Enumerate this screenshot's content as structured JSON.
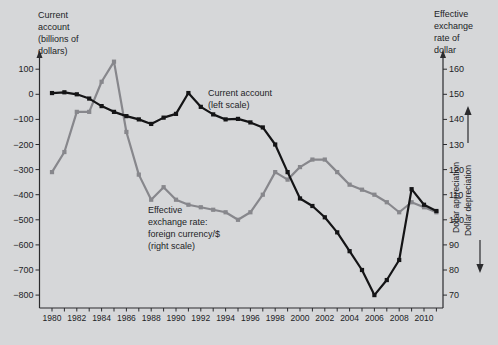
{
  "figure_title": "US current account and effective exchange rate of the dollar, 1980-2011",
  "chart_data": {
    "type": "line",
    "x": [
      1980,
      1981,
      1982,
      1983,
      1984,
      1985,
      1986,
      1987,
      1988,
      1989,
      1990,
      1991,
      1992,
      1993,
      1994,
      1995,
      1996,
      1997,
      1998,
      1999,
      2000,
      2001,
      2002,
      2003,
      2004,
      2005,
      2006,
      2007,
      2008,
      2009,
      2010,
      2011
    ],
    "series": [
      {
        "name": "Current account (left scale)",
        "axis": "left",
        "color": "#141416",
        "values": [
          5,
          8,
          0,
          -17,
          -47,
          -70,
          -87,
          -100,
          -118,
          -93,
          -78,
          5,
          -50,
          -80,
          -100,
          -98,
          -112,
          -132,
          -200,
          -310,
          -415,
          -445,
          -490,
          -550,
          -625,
          -700,
          -800,
          -740,
          -660,
          -378,
          -440,
          -465
        ]
      },
      {
        "name": "Effective exchange rate: foreign currency/$ (right scale)",
        "axis": "right",
        "color": "#87878c",
        "values": [
          119,
          127,
          143,
          143,
          155,
          163,
          135,
          118,
          108,
          113,
          108,
          106,
          105,
          104,
          103,
          100,
          103,
          110,
          119,
          116,
          121,
          124,
          124,
          119,
          114,
          112,
          110,
          107,
          103,
          107,
          105,
          103
        ]
      }
    ],
    "left_axis": {
      "title": "Current\naccount\n(billions of\ndollars)",
      "tick_values": [
        100,
        0,
        -100,
        -200,
        -300,
        -400,
        -500,
        -600,
        -700,
        -800
      ],
      "tick_labels": [
        "100",
        "0",
        "−100",
        "−200",
        "−300",
        "−400",
        "−500",
        "−600",
        "−700",
        "−800"
      ],
      "range": [
        -800,
        100
      ]
    },
    "right_axis": {
      "title": "Effective\nexchange\nrate of\ndollar",
      "tick_values": [
        160,
        150,
        140,
        130,
        120,
        110,
        100,
        90,
        80,
        70
      ],
      "tick_labels": [
        "160",
        "150",
        "140",
        "130",
        "120",
        "110",
        "100",
        "90",
        "80",
        "70"
      ],
      "range": [
        70,
        160
      ]
    },
    "x_axis": {
      "tick_years": [
        1980,
        1981,
        1982,
        1983,
        1984,
        1985,
        1986,
        1987,
        1988,
        1989,
        1990,
        1991,
        1992,
        1993,
        1994,
        1995,
        1996,
        1997,
        1998,
        1999,
        2000,
        2001,
        2002,
        2003,
        2004,
        2005,
        2006,
        2007,
        2008,
        2009,
        2010,
        2011
      ],
      "tick_labels": [
        "1980",
        "1982",
        "1984",
        "1986",
        "1988",
        "1990",
        "1992",
        "1994",
        "1996",
        "1998",
        "2000",
        "2002",
        "2004",
        "2006",
        "2008",
        "2010"
      ],
      "label_interval": 2
    },
    "annotations": {
      "current_account_label": "Current account\n(left scale)",
      "exchange_rate_label": "Effective\nexchange rate:\nforeign currency/$\n(right scale)",
      "appreciation_label": "Dollar appreciation",
      "depreciation_label": "Dollar depreciation"
    },
    "legend_position": "inline-annotations",
    "grid": false,
    "colors": {
      "background": "#d6d7d9",
      "axis": "#2b2b2e",
      "current_account": "#141416",
      "exchange_rate": "#87878c"
    }
  }
}
